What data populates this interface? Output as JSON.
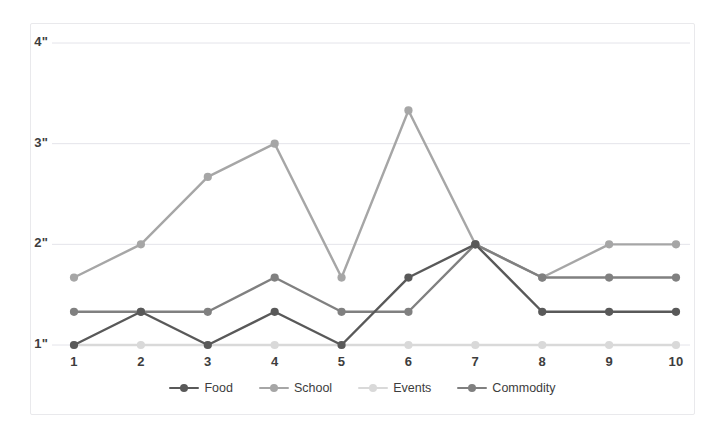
{
  "chart_data": {
    "type": "line",
    "title": "",
    "subtitle": "",
    "xlabel": "",
    "ylabel": "",
    "categories": [
      "1",
      "2",
      "3",
      "4",
      "5",
      "6",
      "7",
      "8",
      "9",
      "10"
    ],
    "x_tick_labels": [
      "1",
      "2",
      "3",
      "4",
      "5",
      "6",
      "7",
      "8",
      "9",
      "10"
    ],
    "y_tick_labels": [
      "1\"",
      "2\"",
      "3\"",
      "4\""
    ],
    "y_tick_values": [
      1,
      2,
      3,
      4
    ],
    "ylim": [
      0.72,
      4.28
    ],
    "xlim": [
      0.5,
      10.5
    ],
    "grid": "horizontal",
    "legend_position": "bottom",
    "markers": "circle",
    "series": [
      {
        "name": "Food",
        "color": "#595959",
        "values": [
          1.0,
          1.33,
          1.0,
          1.33,
          1.0,
          1.67,
          2.0,
          1.33,
          1.33,
          1.33
        ]
      },
      {
        "name": "School",
        "color": "#a6a6a6",
        "values": [
          1.67,
          2.0,
          2.67,
          3.0,
          1.67,
          3.33,
          2.0,
          1.67,
          2.0,
          2.0
        ]
      },
      {
        "name": "Events",
        "color": "#d9d9d9",
        "values": [
          1.0,
          1.0,
          1.0,
          1.0,
          1.0,
          1.0,
          1.0,
          1.0,
          1.0,
          1.0
        ]
      },
      {
        "name": "Commodity",
        "color": "#808080",
        "values": [
          1.33,
          1.33,
          1.33,
          1.67,
          1.33,
          1.33,
          2.0,
          1.67,
          1.67,
          1.67
        ]
      }
    ],
    "annotations": []
  },
  "style": {
    "background": "#ffffff",
    "grid_color": "#e4e4ea",
    "frame_color": "#e9e9ec",
    "tick_text_color": "#3d3d3d"
  },
  "legend": {
    "items": [
      {
        "label": "Food",
        "color": "#595959"
      },
      {
        "label": "School",
        "color": "#a6a6a6"
      },
      {
        "label": "Events",
        "color": "#d9d9d9"
      },
      {
        "label": "Commodity",
        "color": "#808080"
      }
    ]
  }
}
